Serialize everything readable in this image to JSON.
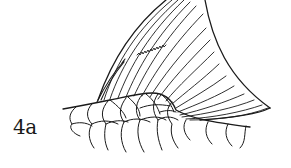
{
  "figure": {
    "label": "4a",
    "colors": {
      "line": "#1a1a1a",
      "background": "#ffffff"
    }
  }
}
